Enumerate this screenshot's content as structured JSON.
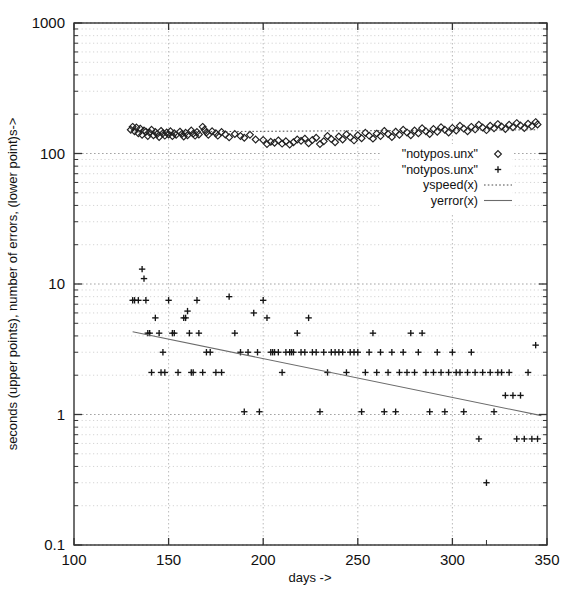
{
  "chart_data": {
    "type": "scatter",
    "title": "",
    "xlabel": "days ->",
    "ylabel": "seconds (upper points), number of errors, (lower point)s->",
    "xscale": "linear",
    "yscale": "log",
    "xlim": [
      100,
      350
    ],
    "ylim": [
      0.1,
      1000
    ],
    "xticks": [
      100,
      150,
      200,
      250,
      300,
      350
    ],
    "xtick_labels": [
      "100",
      "150",
      "200",
      "250",
      "300",
      "350"
    ],
    "yticks": [
      0.1,
      1,
      10,
      100,
      1000
    ],
    "ytick_labels": [
      "0.1",
      "1",
      "10",
      "100",
      "1000"
    ],
    "grid": true,
    "legend_position": "center-right",
    "legend": [
      {
        "label": "\"notypos.unx\"",
        "marker": "diamond",
        "style": "points"
      },
      {
        "label": "\"notypos.unx\"",
        "marker": "plus",
        "style": "points"
      },
      {
        "label": "yspeed(x)",
        "marker": "none",
        "style": "dotted-line"
      },
      {
        "label": "yerror(x)",
        "marker": "none",
        "style": "solid-line"
      }
    ],
    "series": [
      {
        "name": "\"notypos.unx\"",
        "marker": "diamond",
        "comment": "seconds, upper cluster",
        "points": [
          [
            130,
            152
          ],
          [
            131,
            160
          ],
          [
            132,
            148
          ],
          [
            133,
            158
          ],
          [
            134,
            143
          ],
          [
            135,
            155
          ],
          [
            136,
            139
          ],
          [
            137,
            150
          ],
          [
            138,
            147
          ],
          [
            139,
            136
          ],
          [
            140,
            144
          ],
          [
            141,
            152
          ],
          [
            142,
            138
          ],
          [
            143,
            146
          ],
          [
            144,
            141
          ],
          [
            145,
            134
          ],
          [
            146,
            149
          ],
          [
            147,
            143
          ],
          [
            148,
            137
          ],
          [
            149,
            145
          ],
          [
            150,
            140
          ],
          [
            151,
            148
          ],
          [
            152,
            136
          ],
          [
            153,
            143
          ],
          [
            154,
            139
          ],
          [
            156,
            147
          ],
          [
            157,
            141
          ],
          [
            158,
            135
          ],
          [
            159,
            144
          ],
          [
            160,
            138
          ],
          [
            162,
            150
          ],
          [
            163,
            142
          ],
          [
            164,
            137
          ],
          [
            165,
            146
          ],
          [
            166,
            140
          ],
          [
            168,
            160
          ],
          [
            169,
            152
          ],
          [
            170,
            145
          ],
          [
            171,
            139
          ],
          [
            173,
            148
          ],
          [
            175,
            143
          ],
          [
            176,
            137
          ],
          [
            178,
            146
          ],
          [
            180,
            140
          ],
          [
            182,
            133
          ],
          [
            185,
            141
          ],
          [
            188,
            136
          ],
          [
            190,
            132
          ],
          [
            193,
            139
          ],
          [
            196,
            128
          ],
          [
            200,
            127
          ],
          [
            202,
            118
          ],
          [
            204,
            123
          ],
          [
            206,
            121
          ],
          [
            208,
            126
          ],
          [
            210,
            119
          ],
          [
            212,
            124
          ],
          [
            214,
            117
          ],
          [
            216,
            122
          ],
          [
            218,
            128
          ],
          [
            220,
            125
          ],
          [
            222,
            130
          ],
          [
            224,
            120
          ],
          [
            226,
            127
          ],
          [
            228,
            132
          ],
          [
            230,
            118
          ],
          [
            232,
            124
          ],
          [
            234,
            136
          ],
          [
            236,
            129
          ],
          [
            238,
            122
          ],
          [
            240,
            135
          ],
          [
            242,
            128
          ],
          [
            244,
            140
          ],
          [
            246,
            133
          ],
          [
            248,
            126
          ],
          [
            250,
            138
          ],
          [
            252,
            131
          ],
          [
            254,
            144
          ],
          [
            256,
            137
          ],
          [
            258,
            130
          ],
          [
            260,
            142
          ],
          [
            262,
            136
          ],
          [
            264,
            149
          ],
          [
            266,
            141
          ],
          [
            268,
            134
          ],
          [
            270,
            147
          ],
          [
            272,
            139
          ],
          [
            274,
            152
          ],
          [
            276,
            145
          ],
          [
            278,
            138
          ],
          [
            280,
            150
          ],
          [
            282,
            143
          ],
          [
            284,
            156
          ],
          [
            286,
            148
          ],
          [
            288,
            141
          ],
          [
            290,
            154
          ],
          [
            292,
            147
          ],
          [
            294,
            159
          ],
          [
            296,
            152
          ],
          [
            298,
            145
          ],
          [
            300,
            157
          ],
          [
            302,
            150
          ],
          [
            304,
            163
          ],
          [
            306,
            155
          ],
          [
            308,
            148
          ],
          [
            310,
            160
          ],
          [
            312,
            153
          ],
          [
            314,
            166
          ],
          [
            316,
            158
          ],
          [
            318,
            151
          ],
          [
            320,
            163
          ],
          [
            322,
            156
          ],
          [
            324,
            168
          ],
          [
            326,
            161
          ],
          [
            328,
            154
          ],
          [
            330,
            166
          ],
          [
            332,
            159
          ],
          [
            334,
            171
          ],
          [
            336,
            164
          ],
          [
            338,
            157
          ],
          [
            340,
            169
          ],
          [
            342,
            162
          ],
          [
            344,
            174
          ],
          [
            345,
            167
          ]
        ]
      },
      {
        "name": "\"notypos.unx\"",
        "marker": "plus",
        "comment": "number of errors, lower cluster",
        "points": [
          [
            131,
            7.5
          ],
          [
            132,
            7.5
          ],
          [
            134,
            7.5
          ],
          [
            136,
            13
          ],
          [
            137,
            11
          ],
          [
            138,
            7.5
          ],
          [
            139,
            4.2
          ],
          [
            140,
            4.2
          ],
          [
            141,
            2.1
          ],
          [
            143,
            5.5
          ],
          [
            145,
            4.2
          ],
          [
            146,
            2.1
          ],
          [
            147,
            3.0
          ],
          [
            148,
            2.1
          ],
          [
            150,
            7.5
          ],
          [
            152,
            4.2
          ],
          [
            153,
            4.2
          ],
          [
            155,
            2.1
          ],
          [
            158,
            5.5
          ],
          [
            159,
            5.5
          ],
          [
            160,
            6.2
          ],
          [
            161,
            4.2
          ],
          [
            162,
            2.1
          ],
          [
            163,
            2.1
          ],
          [
            165,
            7.5
          ],
          [
            166,
            4.2
          ],
          [
            168,
            2.1
          ],
          [
            170,
            3.0
          ],
          [
            172,
            3.0
          ],
          [
            175,
            2.1
          ],
          [
            178,
            2.1
          ],
          [
            182,
            8.0
          ],
          [
            185,
            4.2
          ],
          [
            188,
            3.0
          ],
          [
            190,
            1.05
          ],
          [
            192,
            3.0
          ],
          [
            195,
            6.0
          ],
          [
            197,
            3.0
          ],
          [
            198,
            1.05
          ],
          [
            200,
            7.5
          ],
          [
            202,
            5.5
          ],
          [
            204,
            3.0
          ],
          [
            205,
            3.0
          ],
          [
            206,
            3.0
          ],
          [
            208,
            3.0
          ],
          [
            210,
            2.1
          ],
          [
            212,
            3.0
          ],
          [
            214,
            3.0
          ],
          [
            215,
            3.0
          ],
          [
            216,
            3.0
          ],
          [
            218,
            4.2
          ],
          [
            220,
            3.0
          ],
          [
            222,
            3.0
          ],
          [
            224,
            5.5
          ],
          [
            226,
            3.0
          ],
          [
            228,
            3.0
          ],
          [
            230,
            1.05
          ],
          [
            232,
            3.0
          ],
          [
            234,
            2.1
          ],
          [
            236,
            3.0
          ],
          [
            238,
            3.0
          ],
          [
            240,
            3.0
          ],
          [
            242,
            3.0
          ],
          [
            244,
            2.1
          ],
          [
            246,
            3.0
          ],
          [
            248,
            3.0
          ],
          [
            250,
            3.0
          ],
          [
            252,
            1.05
          ],
          [
            254,
            2.1
          ],
          [
            256,
            3.0
          ],
          [
            258,
            4.2
          ],
          [
            260,
            2.1
          ],
          [
            262,
            3.0
          ],
          [
            264,
            1.05
          ],
          [
            266,
            2.1
          ],
          [
            268,
            3.0
          ],
          [
            270,
            1.05
          ],
          [
            272,
            2.1
          ],
          [
            274,
            3.0
          ],
          [
            276,
            2.1
          ],
          [
            278,
            4.2
          ],
          [
            280,
            2.1
          ],
          [
            282,
            3.0
          ],
          [
            284,
            4.2
          ],
          [
            286,
            2.1
          ],
          [
            288,
            1.05
          ],
          [
            290,
            2.1
          ],
          [
            292,
            3.0
          ],
          [
            294,
            2.1
          ],
          [
            296,
            1.05
          ],
          [
            298,
            2.1
          ],
          [
            300,
            3.0
          ],
          [
            302,
            2.1
          ],
          [
            304,
            2.1
          ],
          [
            306,
            1.05
          ],
          [
            308,
            2.1
          ],
          [
            310,
            3.0
          ],
          [
            312,
            2.1
          ],
          [
            314,
            0.65
          ],
          [
            316,
            2.1
          ],
          [
            318,
            0.3
          ],
          [
            320,
            2.1
          ],
          [
            322,
            1.05
          ],
          [
            324,
            2.1
          ],
          [
            326,
            2.1
          ],
          [
            328,
            1.4
          ],
          [
            330,
            2.1
          ],
          [
            332,
            1.4
          ],
          [
            334,
            0.65
          ],
          [
            336,
            1.4
          ],
          [
            338,
            0.65
          ],
          [
            340,
            2.1
          ],
          [
            342,
            0.65
          ],
          [
            344,
            3.4
          ],
          [
            345,
            0.65
          ]
        ]
      }
    ],
    "fits": [
      {
        "name": "yspeed(x)",
        "style": "dotted-line",
        "comment": "nearly flat fit through the seconds cluster",
        "x_start": 130,
        "y_start": 146,
        "x_end": 345,
        "y_end": 152
      },
      {
        "name": "yerror(x)",
        "style": "solid-line",
        "comment": "decaying fit through the error cluster",
        "x_start": 131,
        "y_start": 4.3,
        "x_end": 347,
        "y_end": 0.98
      }
    ]
  }
}
